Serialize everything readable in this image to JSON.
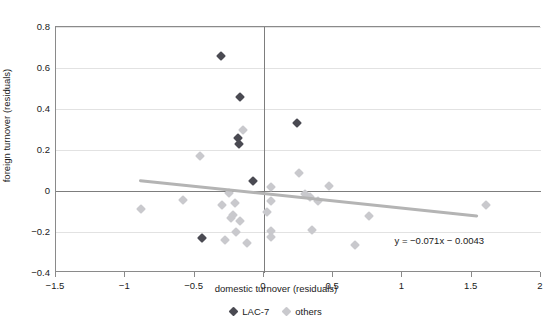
{
  "chart_data": {
    "type": "scatter",
    "title": "",
    "xlabel": "domestic turnover (residuals)",
    "ylabel": "foreign turnover (residuals)",
    "xlim": [
      -1.5,
      2
    ],
    "ylim": [
      -0.4,
      0.8
    ],
    "xticks": [
      "-1.5",
      "-1",
      "-0.5",
      "0",
      "0.5",
      "1",
      "1.5",
      "2"
    ],
    "xtick_values": [
      -1.5,
      -1,
      -0.5,
      0,
      0.5,
      1,
      1.5,
      2
    ],
    "yticks": [
      "0.8",
      "0.6",
      "0.4",
      "0.2",
      "0",
      "-0.2",
      "-0.4"
    ],
    "ytick_values": [
      0.8,
      0.6,
      0.4,
      0.2,
      0,
      -0.2,
      -0.4
    ],
    "grid": true,
    "legend_position": "bottom",
    "annotation": "y = −0.071x − 0.0043",
    "trendline": {
      "slope": -0.071,
      "intercept": -0.0043,
      "x_start": -0.9,
      "x_end": 1.55,
      "color": "#b4b4b4"
    },
    "series": [
      {
        "name": "LAC-7",
        "marker": "diamond",
        "color": "#4a4a52",
        "points": [
          [
            -0.31,
            0.66
          ],
          [
            -0.17,
            0.46
          ],
          [
            -0.19,
            0.26
          ],
          [
            -0.18,
            0.23
          ],
          [
            0.24,
            0.33
          ],
          [
            -0.08,
            0.05
          ],
          [
            -0.45,
            -0.23
          ]
        ]
      },
      {
        "name": "others",
        "marker": "diamond",
        "color": "#c9c9cd",
        "points": [
          [
            -0.15,
            0.3
          ],
          [
            -0.46,
            0.17
          ],
          [
            0.25,
            0.09
          ],
          [
            0.47,
            0.025
          ],
          [
            0.05,
            0.02
          ],
          [
            -0.25,
            -0.01
          ],
          [
            0.3,
            -0.015
          ],
          [
            0.33,
            -0.03
          ],
          [
            -0.58,
            -0.045
          ],
          [
            0.05,
            -0.05
          ],
          [
            0.39,
            -0.05
          ],
          [
            -0.3,
            -0.07
          ],
          [
            -0.21,
            -0.06
          ],
          [
            -0.89,
            -0.09
          ],
          [
            1.6,
            -0.07
          ],
          [
            0.02,
            -0.1
          ],
          [
            -0.22,
            -0.115
          ],
          [
            -0.24,
            -0.13
          ],
          [
            0.76,
            -0.12
          ],
          [
            -0.17,
            -0.145
          ],
          [
            -0.2,
            -0.2
          ],
          [
            0.05,
            -0.195
          ],
          [
            0.35,
            -0.19
          ],
          [
            0.05,
            -0.225
          ],
          [
            -0.45,
            -0.23
          ],
          [
            -0.28,
            -0.24
          ],
          [
            -0.12,
            -0.255
          ],
          [
            0.66,
            -0.265
          ]
        ]
      }
    ]
  }
}
